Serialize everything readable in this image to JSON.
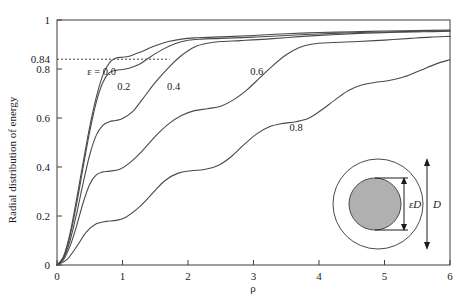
{
  "chart_data": {
    "type": "line",
    "title": "",
    "xlabel": "ρ",
    "ylabel": "Radial distribution of energy",
    "xlim": [
      0,
      6
    ],
    "ylim": [
      0,
      1
    ],
    "xticks": [
      "0",
      "1",
      "2",
      "3",
      "4",
      "5",
      "6"
    ],
    "xtick_values": [
      0,
      1,
      2,
      3,
      4,
      5,
      6
    ],
    "yticks": [
      "0",
      "0.2",
      "0.4",
      "0.6",
      "0.8",
      "0.84",
      "1"
    ],
    "ytick_values": [
      0,
      0.2,
      0.4,
      0.6,
      0.8,
      0.84,
      1
    ],
    "grid": false,
    "legend": "inline-curve-labels",
    "annotations": [
      {
        "text": "ε = 0.0",
        "x": 0.68,
        "y": 0.775
      },
      {
        "text": "0.2",
        "x": 1.02,
        "y": 0.715
      },
      {
        "text": "0.4",
        "x": 1.78,
        "y": 0.715
      },
      {
        "text": "0.6",
        "x": 3.05,
        "y": 0.775
      },
      {
        "text": "0.8",
        "x": 3.65,
        "y": 0.545
      }
    ],
    "reference_line": {
      "y": 0.84,
      "style": "dashed",
      "x_from": 0,
      "x_to": 1.72,
      "label": "0.84"
    },
    "series": [
      {
        "name": "ε = 0.0",
        "epsilon": 0.0,
        "points": [
          [
            0,
            0
          ],
          [
            0.1,
            0.035
          ],
          [
            0.2,
            0.13
          ],
          [
            0.3,
            0.27
          ],
          [
            0.4,
            0.42
          ],
          [
            0.5,
            0.565
          ],
          [
            0.6,
            0.685
          ],
          [
            0.7,
            0.775
          ],
          [
            0.8,
            0.825
          ],
          [
            0.9,
            0.845
          ],
          [
            1.0,
            0.848
          ],
          [
            1.1,
            0.852
          ],
          [
            1.2,
            0.862
          ],
          [
            1.35,
            0.878
          ],
          [
            1.5,
            0.895
          ],
          [
            1.7,
            0.912
          ],
          [
            1.9,
            0.922
          ],
          [
            2.1,
            0.927
          ],
          [
            2.3,
            0.929
          ],
          [
            2.6,
            0.932
          ],
          [
            3.0,
            0.937
          ],
          [
            3.5,
            0.944
          ],
          [
            4.0,
            0.949
          ],
          [
            4.5,
            0.952
          ],
          [
            5.0,
            0.955
          ],
          [
            5.5,
            0.957
          ],
          [
            6.0,
            0.959
          ]
        ]
      },
      {
        "name": "ε = 0.2",
        "epsilon": 0.2,
        "points": [
          [
            0,
            0
          ],
          [
            0.1,
            0.032
          ],
          [
            0.2,
            0.12
          ],
          [
            0.3,
            0.25
          ],
          [
            0.4,
            0.4
          ],
          [
            0.5,
            0.545
          ],
          [
            0.6,
            0.665
          ],
          [
            0.7,
            0.745
          ],
          [
            0.8,
            0.785
          ],
          [
            0.9,
            0.795
          ],
          [
            1.0,
            0.798
          ],
          [
            1.1,
            0.803
          ],
          [
            1.25,
            0.818
          ],
          [
            1.4,
            0.845
          ],
          [
            1.6,
            0.878
          ],
          [
            1.8,
            0.903
          ],
          [
            2.0,
            0.917
          ],
          [
            2.2,
            0.922
          ],
          [
            2.5,
            0.925
          ],
          [
            3.0,
            0.93
          ],
          [
            3.5,
            0.937
          ],
          [
            4.0,
            0.943
          ],
          [
            4.5,
            0.948
          ],
          [
            5.0,
            0.951
          ],
          [
            5.5,
            0.954
          ],
          [
            6.0,
            0.956
          ]
        ]
      },
      {
        "name": "ε = 0.4",
        "epsilon": 0.4,
        "points": [
          [
            0,
            0
          ],
          [
            0.1,
            0.028
          ],
          [
            0.2,
            0.1
          ],
          [
            0.3,
            0.21
          ],
          [
            0.4,
            0.335
          ],
          [
            0.5,
            0.45
          ],
          [
            0.6,
            0.53
          ],
          [
            0.7,
            0.57
          ],
          [
            0.8,
            0.585
          ],
          [
            0.9,
            0.59
          ],
          [
            1.0,
            0.598
          ],
          [
            1.15,
            0.625
          ],
          [
            1.3,
            0.675
          ],
          [
            1.5,
            0.745
          ],
          [
            1.7,
            0.805
          ],
          [
            1.9,
            0.855
          ],
          [
            2.1,
            0.89
          ],
          [
            2.3,
            0.905
          ],
          [
            2.5,
            0.912
          ],
          [
            2.8,
            0.916
          ],
          [
            3.2,
            0.922
          ],
          [
            3.7,
            0.932
          ],
          [
            4.2,
            0.94
          ],
          [
            4.7,
            0.946
          ],
          [
            5.2,
            0.95
          ],
          [
            5.6,
            0.952
          ],
          [
            6.0,
            0.954
          ]
        ]
      },
      {
        "name": "ε = 0.6",
        "epsilon": 0.6,
        "points": [
          [
            0,
            0
          ],
          [
            0.1,
            0.022
          ],
          [
            0.2,
            0.078
          ],
          [
            0.3,
            0.16
          ],
          [
            0.4,
            0.255
          ],
          [
            0.5,
            0.33
          ],
          [
            0.6,
            0.368
          ],
          [
            0.7,
            0.38
          ],
          [
            0.8,
            0.383
          ],
          [
            0.95,
            0.39
          ],
          [
            1.1,
            0.415
          ],
          [
            1.3,
            0.465
          ],
          [
            1.5,
            0.525
          ],
          [
            1.7,
            0.575
          ],
          [
            1.9,
            0.61
          ],
          [
            2.1,
            0.63
          ],
          [
            2.3,
            0.638
          ],
          [
            2.5,
            0.648
          ],
          [
            2.7,
            0.675
          ],
          [
            2.9,
            0.715
          ],
          [
            3.1,
            0.765
          ],
          [
            3.3,
            0.815
          ],
          [
            3.5,
            0.858
          ],
          [
            3.7,
            0.888
          ],
          [
            3.9,
            0.902
          ],
          [
            4.2,
            0.908
          ],
          [
            4.6,
            0.912
          ],
          [
            5.0,
            0.918
          ],
          [
            5.4,
            0.925
          ],
          [
            5.7,
            0.93
          ],
          [
            6.0,
            0.933
          ]
        ]
      },
      {
        "name": "ε = 0.8",
        "epsilon": 0.8,
        "points": [
          [
            0,
            0
          ],
          [
            0.15,
            0.022
          ],
          [
            0.3,
            0.075
          ],
          [
            0.45,
            0.135
          ],
          [
            0.6,
            0.168
          ],
          [
            0.75,
            0.178
          ],
          [
            0.9,
            0.182
          ],
          [
            1.05,
            0.195
          ],
          [
            1.25,
            0.235
          ],
          [
            1.45,
            0.29
          ],
          [
            1.65,
            0.345
          ],
          [
            1.85,
            0.375
          ],
          [
            2.05,
            0.385
          ],
          [
            2.25,
            0.39
          ],
          [
            2.45,
            0.405
          ],
          [
            2.65,
            0.44
          ],
          [
            2.85,
            0.49
          ],
          [
            3.05,
            0.535
          ],
          [
            3.25,
            0.565
          ],
          [
            3.45,
            0.578
          ],
          [
            3.65,
            0.585
          ],
          [
            3.85,
            0.6
          ],
          [
            4.05,
            0.635
          ],
          [
            4.25,
            0.675
          ],
          [
            4.45,
            0.712
          ],
          [
            4.65,
            0.735
          ],
          [
            4.85,
            0.745
          ],
          [
            5.05,
            0.752
          ],
          [
            5.3,
            0.768
          ],
          [
            5.55,
            0.795
          ],
          [
            5.8,
            0.822
          ],
          [
            6.0,
            0.838
          ]
        ]
      }
    ]
  },
  "inset": {
    "name": "fiber-cross-section-diagram",
    "outer_label": "D",
    "inner_label": "εD",
    "inner_fill": "#b0b0b0",
    "outer_fill": "#ffffff"
  }
}
